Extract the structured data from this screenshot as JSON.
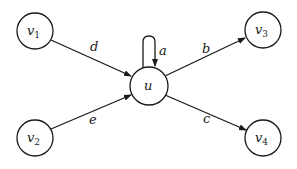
{
  "diagram": {
    "type": "directed-graph",
    "colors": {
      "stroke": "#1a1a1a",
      "background": "#ffffff"
    },
    "nodes": [
      {
        "id": "v1",
        "name": "v",
        "sub": "1",
        "x": 35,
        "y": 31
      },
      {
        "id": "v2",
        "name": "v",
        "sub": "2",
        "x": 35,
        "y": 138
      },
      {
        "id": "u",
        "name": "u",
        "sub": "",
        "x": 149,
        "y": 86
      },
      {
        "id": "v3",
        "name": "v",
        "sub": "3",
        "x": 263,
        "y": 30
      },
      {
        "id": "v4",
        "name": "v",
        "sub": "4",
        "x": 263,
        "y": 138
      }
    ],
    "edges": [
      {
        "from": "v1",
        "to": "u",
        "label": "d"
      },
      {
        "from": "v2",
        "to": "u",
        "label": "e"
      },
      {
        "from": "u",
        "to": "u",
        "label": "a"
      },
      {
        "from": "u",
        "to": "v3",
        "label": "b"
      },
      {
        "from": "u",
        "to": "v4",
        "label": "c"
      }
    ]
  }
}
